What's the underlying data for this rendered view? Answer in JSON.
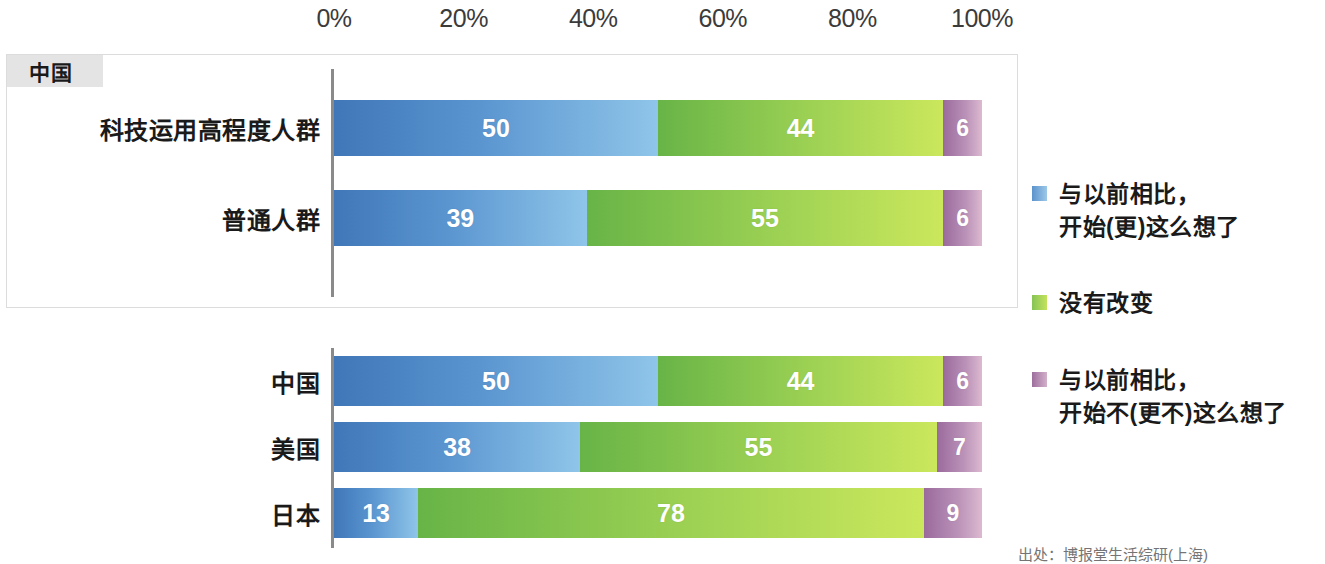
{
  "axis": {
    "ticks": [
      "0%",
      "20%",
      "40%",
      "60%",
      "80%",
      "100%"
    ],
    "min": 0,
    "max": 100
  },
  "highlight_panel": {
    "tab_label": "中国"
  },
  "legend": {
    "items": [
      {
        "label": "与以前相比，\n开始(更)这么想了",
        "swatch": "blue-swatch-icon",
        "color": "#5b93cc"
      },
      {
        "label": "没有改变",
        "swatch": "green-swatch-icon",
        "color": "#86c455"
      },
      {
        "label": "与以前相比，\n开始不(更不)这么想了",
        "swatch": "purple-swatch-icon",
        "color": "#9d6e9e"
      }
    ]
  },
  "source_note": "出处：博报堂生活综研(上海)",
  "chart_data": {
    "type": "bar",
    "orientation": "horizontal",
    "stacked": true,
    "stack_total": 100,
    "title": "",
    "xlabel": "",
    "ylabel": "",
    "xlim": [
      0,
      100
    ],
    "xticks": [
      0,
      20,
      40,
      60,
      80,
      100
    ],
    "xticklabels": [
      "0%",
      "20%",
      "40%",
      "60%",
      "80%",
      "100%"
    ],
    "grid": false,
    "legend_position": "right",
    "series": [
      {
        "name": "与以前相比，开始(更)这么想了",
        "color": "#5b93cc"
      },
      {
        "name": "没有改变",
        "color": "#86c455"
      },
      {
        "name": "与以前相比，开始不(更不)这么想了",
        "color": "#9d6e9e"
      }
    ],
    "panels": [
      {
        "panel_label": "中国",
        "highlighted": true,
        "categories": [
          "科技运用高程度人群",
          "普通人群"
        ],
        "rows": [
          {
            "category": "科技运用高程度人群",
            "values": [
              50,
              44,
              6
            ]
          },
          {
            "category": "普通人群",
            "values": [
              39,
              55,
              6
            ]
          }
        ]
      },
      {
        "panel_label": "",
        "highlighted": false,
        "categories": [
          "中国",
          "美国",
          "日本"
        ],
        "rows": [
          {
            "category": "中国",
            "values": [
              50,
              44,
              6
            ]
          },
          {
            "category": "美国",
            "values": [
              38,
              55,
              7
            ]
          },
          {
            "category": "日本",
            "values": [
              13,
              78,
              9
            ]
          }
        ]
      }
    ]
  }
}
